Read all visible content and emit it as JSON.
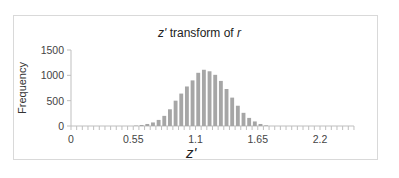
{
  "chart_data": {
    "type": "bar",
    "title": "z' transform of r",
    "xlabel": "z'",
    "ylabel": "Frequency",
    "ylim": [
      0,
      1500
    ],
    "yticks": [
      0,
      500,
      1000,
      1500
    ],
    "xticks": [
      "0",
      "0.55",
      "1.1",
      "1.65",
      "2.2"
    ],
    "bin_width": 0.05,
    "x_range": [
      0,
      2.5
    ],
    "grid": false,
    "legend": "none",
    "bar_color": "#a6a6a6",
    "bins": [
      0.55,
      0.6,
      0.65,
      0.7,
      0.75,
      0.8,
      0.85,
      0.9,
      0.95,
      1.0,
      1.05,
      1.1,
      1.15,
      1.2,
      1.25,
      1.3,
      1.35,
      1.4,
      1.45,
      1.5,
      1.55,
      1.6,
      1.65,
      1.7
    ],
    "values": [
      8,
      20,
      40,
      70,
      120,
      200,
      330,
      500,
      640,
      780,
      900,
      1050,
      1110,
      1080,
      1010,
      890,
      730,
      560,
      400,
      260,
      160,
      90,
      40,
      12
    ]
  },
  "title_main": "z' transform of ",
  "title_var": "r",
  "xlabel": "z'",
  "ylabel": "Frequency"
}
